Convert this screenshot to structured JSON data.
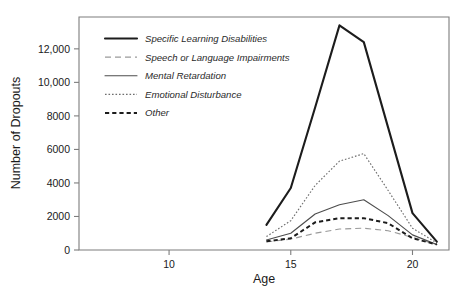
{
  "chart_data": {
    "type": "line",
    "title": "",
    "xlabel": "Age",
    "ylabel": "Number of Dropouts",
    "xlim": [
      6.3,
      21.5
    ],
    "ylim": [
      0,
      13900
    ],
    "grid": false,
    "legend_position": "upper-left-inside",
    "x_ticks": [
      10,
      15,
      20
    ],
    "x_tick_labels": [
      "10",
      "15",
      "20"
    ],
    "y_ticks": [
      0,
      2000,
      4000,
      6000,
      8000,
      10000,
      12000
    ],
    "y_tick_labels": [
      "0",
      "2000",
      "4000",
      "6000",
      "8000",
      "10,000",
      "12,000"
    ],
    "x": [
      14,
      15,
      16,
      17,
      18,
      19,
      20,
      21
    ],
    "series": [
      {
        "name": "Specific Learning Disabilities",
        "style": "thick-solid",
        "color": "#1c1c1c",
        "values": [
          1500,
          3700,
          8500,
          13400,
          12400,
          7300,
          2200,
          500
        ]
      },
      {
        "name": "Speech or Language Impairments",
        "style": "gray-long-dash",
        "color": "#9a9a9a",
        "values": [
          480,
          650,
          1000,
          1250,
          1300,
          1150,
          750,
          330
        ]
      },
      {
        "name": "Mental Retardation",
        "style": "thin-solid",
        "color": "#4d4d4d",
        "values": [
          600,
          1000,
          2150,
          2700,
          3000,
          2050,
          900,
          330
        ]
      },
      {
        "name": "Emotional Disturbance",
        "style": "fine-dotted",
        "color": "#6e6e6e",
        "values": [
          800,
          1750,
          3850,
          5300,
          5750,
          3550,
          1300,
          420
        ]
      },
      {
        "name": "Other",
        "style": "thick-dash",
        "color": "#1c1c1c",
        "values": [
          520,
          700,
          1650,
          1900,
          1900,
          1600,
          700,
          330
        ]
      }
    ]
  },
  "legend": {
    "entries": [
      {
        "label": "Specific Learning Disabilities"
      },
      {
        "label": "Speech or Language Impairments"
      },
      {
        "label": "Mental Retardation"
      },
      {
        "label": "Emotional Disturbance"
      },
      {
        "label": "Other"
      }
    ]
  }
}
